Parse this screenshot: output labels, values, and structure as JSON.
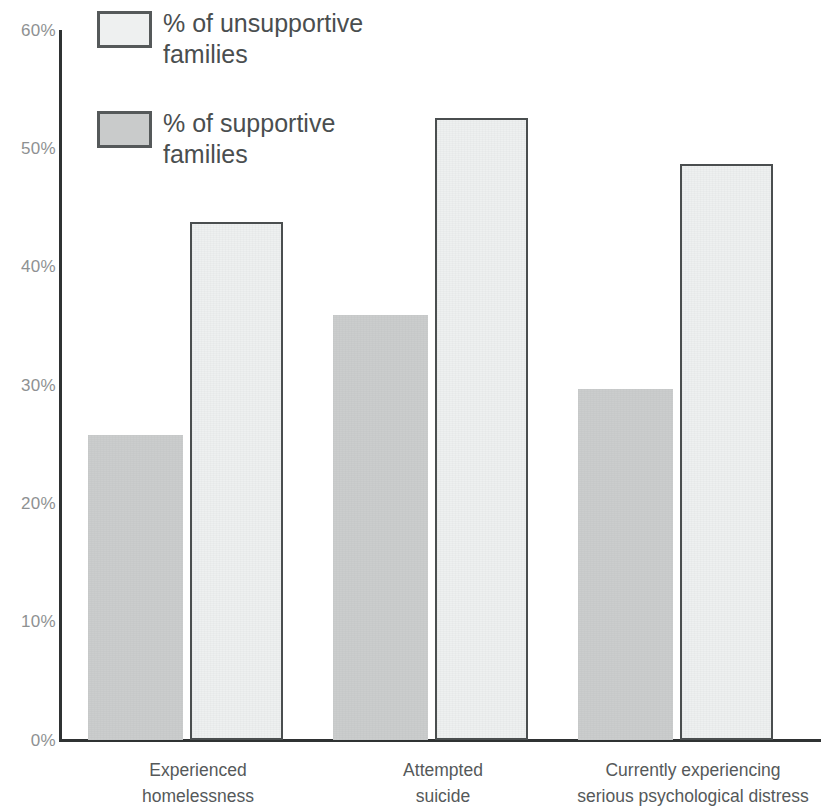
{
  "chart_data": {
    "type": "bar",
    "title": "",
    "xlabel": "",
    "ylabel": "",
    "ylim": [
      0,
      60
    ],
    "ytick_labels": [
      "60%",
      "50%",
      "40%",
      "30%",
      "20%",
      "10%",
      "0%"
    ],
    "ytick_values": [
      60,
      50,
      40,
      30,
      20,
      10,
      0
    ],
    "grid": false,
    "legend_position": "top-left",
    "categories": [
      "Experienced\nhomelessness",
      "Attempted\nsuicide",
      "Currently experiencing\nserious psychological distress"
    ],
    "series": [
      {
        "name": "% of supportive families",
        "values": [
          25.8,
          35.9,
          29.7
        ],
        "color": "#cbcdcd"
      },
      {
        "name": "% of unsupportive families",
        "values": [
          43.8,
          52.6,
          48.7
        ],
        "color": "#eef0f0"
      }
    ]
  },
  "legend": {
    "items": [
      {
        "label": "% of unsupportive\nfamilies",
        "style": "unsupportive"
      },
      {
        "label": "% of supportive\nfamilies",
        "style": "supportive"
      }
    ]
  },
  "axis": {
    "y_labels": [
      "60%",
      "50%",
      "40%",
      "30%",
      "20%",
      "10%",
      "0%"
    ]
  },
  "colors": {
    "unsupportive_fill": "#eef0f0",
    "unsupportive_border": "#4a4e4f",
    "supportive_fill": "#cbcdcd",
    "axis": "#2f3233",
    "tick_text": "#8e9192",
    "label_text": "#55595a"
  }
}
